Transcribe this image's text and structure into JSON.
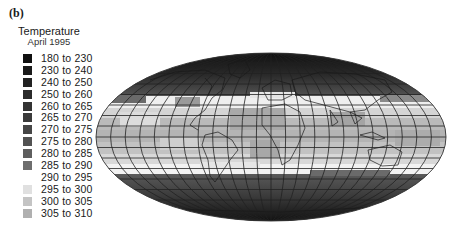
{
  "panel_label": "(b)",
  "legend": {
    "title": "Temperature",
    "subtitle": "April 1995",
    "items": [
      {
        "label": "180 to 230",
        "color": "#101010"
      },
      {
        "label": "230 to 240",
        "color": "#1a1a1a"
      },
      {
        "label": "240 to 250",
        "color": "#222222"
      },
      {
        "label": "250 to 260",
        "color": "#2b2b2b"
      },
      {
        "label": "260 to 265",
        "color": "#333333"
      },
      {
        "label": "265 to 270",
        "color": "#3b3b3b"
      },
      {
        "label": "270 to 275",
        "color": "#464646"
      },
      {
        "label": "275 to 280",
        "color": "#525252"
      },
      {
        "label": "280 to 285",
        "color": "#5e5e5e"
      },
      {
        "label": "285 to 290",
        "color": "#6e6e6e"
      },
      {
        "label": "290 to 295",
        "color": "#ffffff"
      },
      {
        "label": "295 to 300",
        "color": "#e0e0e0"
      },
      {
        "label": "300 to 305",
        "color": "#c4c4c4"
      },
      {
        "label": "305 to 310",
        "color": "#b0b0b0"
      }
    ]
  },
  "map": {
    "projection": "Mollweide (global)",
    "graticule": {
      "meridian_spacing_deg": 15,
      "parallel_spacing_deg": 10
    },
    "variable": "Temperature (K)",
    "period": "April 1995"
  }
}
